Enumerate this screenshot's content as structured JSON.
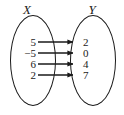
{
  "figure": {
    "type": "mapping-diagram",
    "background_color": "#ffffff",
    "ink_color": "#1a1a1a"
  },
  "sets": {
    "domain": {
      "label": "X",
      "values": [
        "5",
        "-5",
        "6",
        "2"
      ]
    },
    "range": {
      "label": "Y",
      "values": [
        "2",
        "0",
        "4",
        "7"
      ]
    }
  },
  "mappings": [
    {
      "from": "5",
      "to": "2",
      "row": 0
    },
    {
      "from": "-5",
      "to": "0",
      "row": 1
    },
    {
      "from": "6",
      "to": "4",
      "row": 2
    },
    {
      "from": "2",
      "to": "7",
      "row": 3
    }
  ],
  "geometry": {
    "row_y": [
      42,
      53,
      64,
      75
    ],
    "line_start_x": 38,
    "line_end_x": 72,
    "arrow_tip_x": 79
  },
  "icons": {
    "arrow": "arrow-right-icon",
    "ellipse": "ellipse-outline-icon"
  }
}
